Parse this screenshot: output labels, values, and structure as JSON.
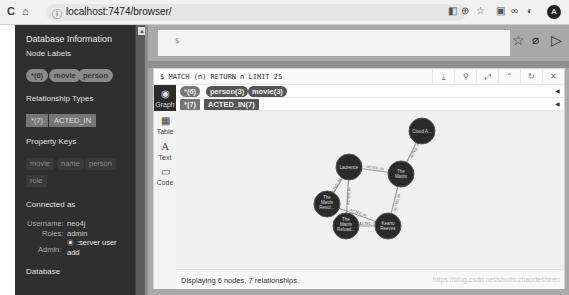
{
  "browser": {
    "url": "localhost:7474/browser/",
    "nav": {
      "reload": "C",
      "home": "⌂",
      "info": "ⓘ"
    },
    "extensions": [
      "◧",
      "⊕",
      "☆",
      "▣",
      "∞",
      "◐"
    ],
    "avatar": "A"
  },
  "sidebar": {
    "title": "Database Information",
    "node_labels_heading": "Node Labels",
    "node_labels": [
      "*(6)",
      "movie",
      "person"
    ],
    "relationship_types_heading": "Relationship Types",
    "relationship_types": [
      "*(7)",
      "ACTED_IN"
    ],
    "property_keys_heading": "Property Keys",
    "property_keys": [
      "movie",
      "name",
      "person",
      "role"
    ],
    "connected_heading": "Connected as",
    "username_label": "Username:",
    "username": "neo4j",
    "roles_label": "Roles:",
    "roles": "admin",
    "admin_label": "Admin:",
    "admin_cmd_1": ":server user",
    "admin_cmd_2": "add",
    "database_heading": "Database"
  },
  "editor": {
    "prompt": "$",
    "icons": {
      "favorite": "☆",
      "clear": "⌀",
      "run": "▷"
    }
  },
  "result": {
    "query": "$ MATCH (n) RETURN n LIMIT 25",
    "header_icons": [
      "⤓",
      "⚲",
      "⤢",
      "⌃",
      "↻",
      "✕"
    ],
    "tabs": [
      {
        "label": "Graph",
        "icon": "◉"
      },
      {
        "label": "Table",
        "icon": "▦"
      },
      {
        "label": "Text",
        "icon": "A"
      },
      {
        "label": "Code",
        "icon": "▭"
      }
    ],
    "node_label_pills": [
      "*(6)",
      "person(3)",
      "movie(3)"
    ],
    "rel_type_pills": [
      "*(7)",
      "ACTED_IN(7)"
    ],
    "status": "Displaying 6 nodes, 7 relationships.",
    "watermark": "https://blog.csdn.net/shuibuzhaodeshiren"
  },
  "graph": {
    "nodes": [
      {
        "id": "cloud",
        "label": "Cloud A..."
      },
      {
        "id": "matrix",
        "label1": "The",
        "label2": "Matrix"
      },
      {
        "id": "laurence",
        "label": "Laurence"
      },
      {
        "id": "revol",
        "label1": "The",
        "label2": "Matrix",
        "label3": "Revol..."
      },
      {
        "id": "reload",
        "label1": "The",
        "label2": "Matrix",
        "label3": "Reload..."
      },
      {
        "id": "keanu",
        "label1": "Keanu",
        "label2": "Reeves"
      }
    ],
    "edge_label": "ACTED_IN"
  },
  "colors": {
    "sidebar_bg": "#2f2f2f",
    "node_fill": "#2a2a2a",
    "pill_bg": "#555555"
  }
}
